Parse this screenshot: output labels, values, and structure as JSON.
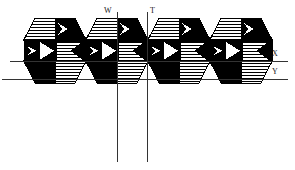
{
  "figure": {
    "type": "geometric-tiling-diagram",
    "canvas": {
      "width": 295,
      "height": 170,
      "background": "#ffffff"
    },
    "colors": {
      "black": "#000000",
      "white": "#ffffff",
      "hatch_line": "#000000",
      "outline": "#000000",
      "axis_line": "#333333",
      "label_text": "#1a1a1a"
    },
    "hatch": {
      "orientation": "horizontal",
      "spacing_px": 3,
      "line_width_px": 1
    },
    "tiling": {
      "unit_cell_width": 62,
      "unit_cell_height": 65,
      "columns": 4,
      "rows": 2,
      "origin_x": 24,
      "origin_y": 18,
      "tile_shape": "elongated-hexagon",
      "fills_per_tile": [
        "black",
        "white",
        "hatched"
      ]
    },
    "axes": [
      {
        "id": "W",
        "label": "W",
        "orientation": "vertical",
        "position_px": 117,
        "from_px": 12,
        "to_px": 162,
        "label_x": 104,
        "label_y": 7
      },
      {
        "id": "T",
        "label": "T",
        "orientation": "vertical",
        "position_px": 147,
        "from_px": 12,
        "to_px": 162,
        "label_x": 150,
        "label_y": 7
      },
      {
        "id": "X",
        "label": "X",
        "orientation": "horizontal",
        "position_px": 61,
        "from_px": 10,
        "to_px": 288,
        "label_x": 272,
        "label_y": 50
      },
      {
        "id": "Y",
        "label": "Y",
        "orientation": "horizontal",
        "position_px": 79,
        "from_px": 2,
        "to_px": 288,
        "label_x": 272,
        "label_y": 68
      }
    ],
    "axis_labels": {
      "w": "W",
      "t": "T",
      "x": "X",
      "y": "Y"
    }
  }
}
